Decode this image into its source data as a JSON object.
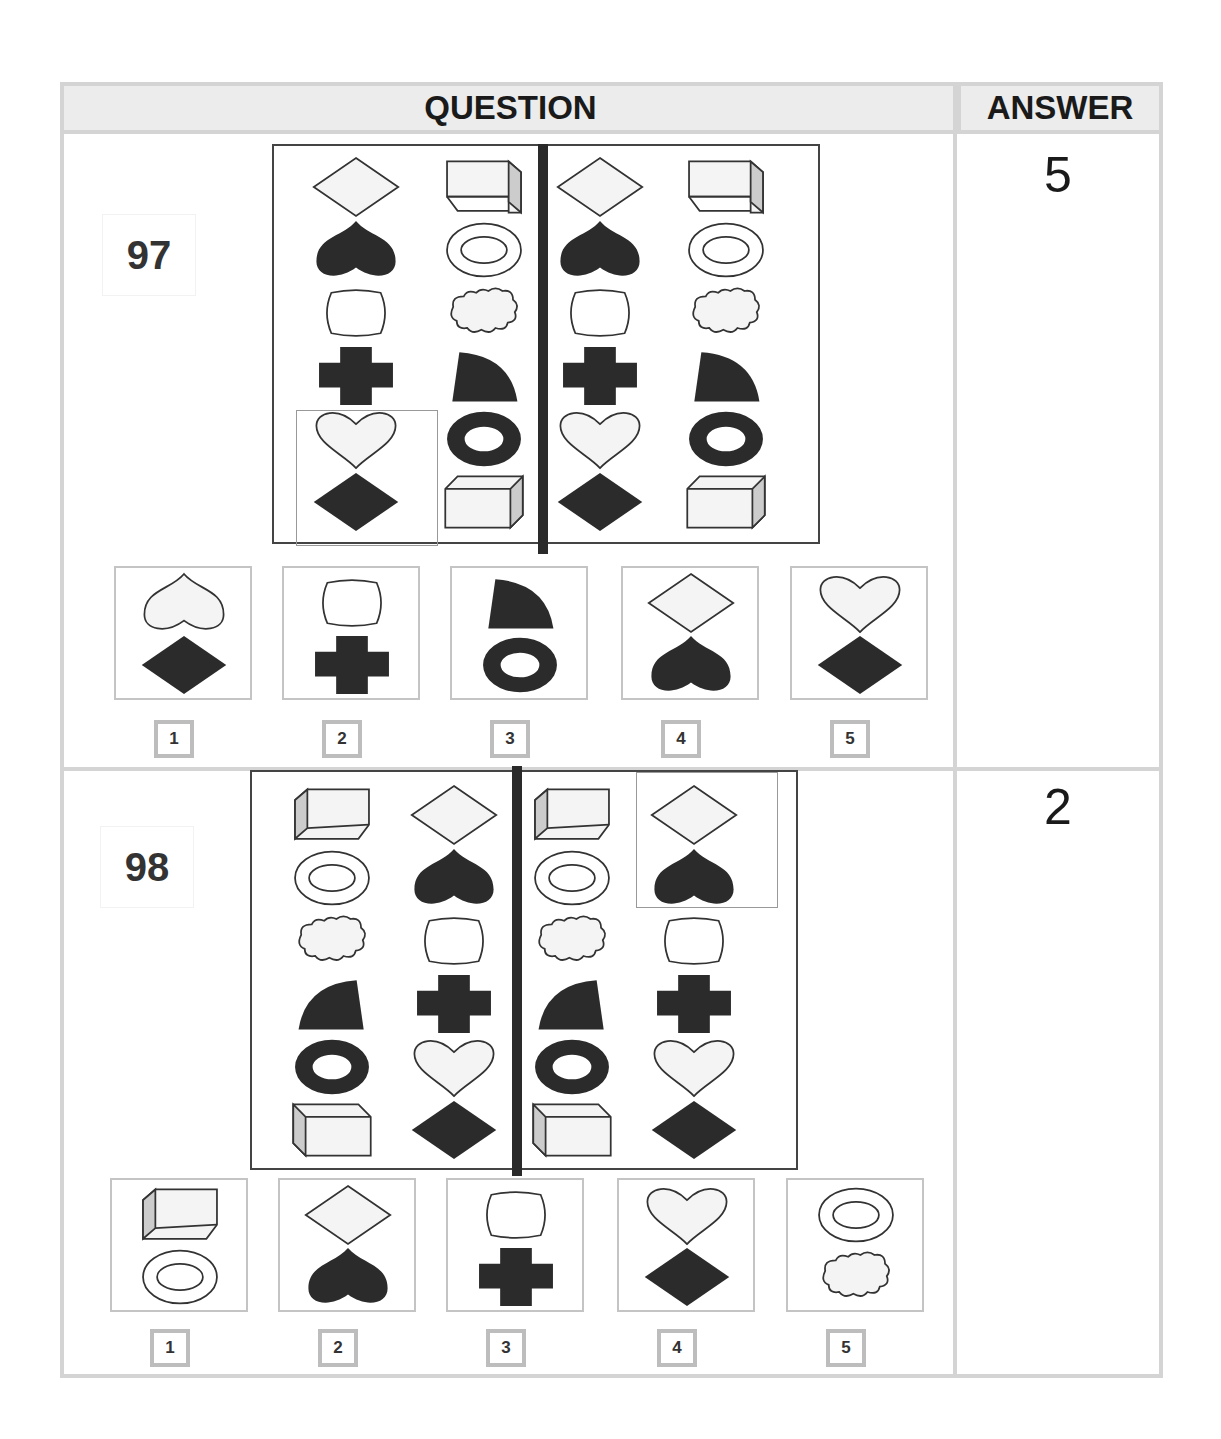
{
  "header": {
    "question_label": "QUESTION",
    "answer_label": "ANSWER"
  },
  "questions": [
    {
      "number": "97",
      "answer": "5",
      "grid_left_columns": [
        [
          "white-diamond",
          "white-box-right"
        ],
        [
          "black-heart",
          "white-ring"
        ],
        [
          "white-rounded-rect",
          "white-cloud"
        ],
        [
          "black-cross",
          "black-quarter-circle"
        ],
        [
          "white-heart",
          "black-ring"
        ],
        [
          "black-diamond",
          "white-box-front"
        ]
      ],
      "grid_right_columns": [
        [
          "white-diamond",
          "white-box-right"
        ],
        [
          "black-heart",
          "white-ring"
        ],
        [
          "white-rounded-rect",
          "white-cloud"
        ],
        [
          "black-cross",
          "black-quarter-circle"
        ],
        [
          "white-heart",
          "black-ring"
        ],
        [
          "black-diamond",
          "white-box-front"
        ]
      ],
      "options": [
        {
          "label": "1",
          "top": "white-heart-inverted",
          "bottom": "black-diamond"
        },
        {
          "label": "2",
          "top": "white-rounded-rect",
          "bottom": "black-cross"
        },
        {
          "label": "3",
          "top": "black-quarter-circle",
          "bottom": "black-ring"
        },
        {
          "label": "4",
          "top": "white-diamond",
          "bottom": "black-heart"
        },
        {
          "label": "5",
          "top": "white-heart",
          "bottom": "black-diamond"
        }
      ]
    },
    {
      "number": "98",
      "answer": "2",
      "grid_left_columns": [
        [
          "white-box-left",
          "white-diamond"
        ],
        [
          "white-ring",
          "black-heart"
        ],
        [
          "white-cloud",
          "white-rounded-rect"
        ],
        [
          "black-quarter-circle-mirrored",
          "black-cross"
        ],
        [
          "black-ring",
          "white-heart"
        ],
        [
          "white-box-front-left",
          "black-diamond"
        ]
      ],
      "grid_right_columns": [
        [
          "white-box-left",
          "white-diamond"
        ],
        [
          "white-ring",
          "black-heart"
        ],
        [
          "white-cloud",
          "white-rounded-rect"
        ],
        [
          "black-quarter-circle-mirrored",
          "black-cross"
        ],
        [
          "black-ring",
          "white-heart"
        ],
        [
          "white-box-front-left",
          "black-diamond"
        ]
      ],
      "options": [
        {
          "label": "1",
          "top": "white-box-left",
          "bottom": "white-ring"
        },
        {
          "label": "2",
          "top": "white-diamond",
          "bottom": "black-heart"
        },
        {
          "label": "3",
          "top": "white-rounded-rect",
          "bottom": "black-cross"
        },
        {
          "label": "4",
          "top": "white-heart",
          "bottom": "black-diamond"
        },
        {
          "label": "5",
          "top": "white-ring",
          "bottom": "white-cloud"
        }
      ]
    }
  ],
  "colors": {
    "border": "#d4d4d4",
    "header_bg": "#ececec",
    "shape_dark": "#2b2b2b",
    "shape_light": "#f4f4f4"
  }
}
